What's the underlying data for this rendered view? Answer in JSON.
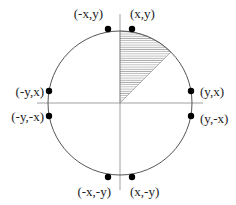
{
  "diagram": {
    "center": {
      "x": 120,
      "y": 103
    },
    "radius": 72,
    "colors": {
      "stroke": "#555555",
      "axis": "#888888",
      "dot": "#000000",
      "hatch": "#666666"
    },
    "shaded_octant": {
      "from_deg": 45,
      "to_deg": 90
    },
    "points": [
      {
        "label": "(x,y)",
        "cx": 132,
        "cy": 29,
        "lx": 130,
        "ly": 18,
        "anchor": "start"
      },
      {
        "label": "(-x,y)",
        "cx": 108,
        "cy": 29,
        "lx": 103,
        "ly": 18,
        "anchor": "end"
      },
      {
        "label": "(y,x)",
        "cx": 191,
        "cy": 91,
        "lx": 200,
        "ly": 96,
        "anchor": "start"
      },
      {
        "label": "(-y,x)",
        "cx": 49,
        "cy": 91,
        "lx": 44,
        "ly": 96,
        "anchor": "end"
      },
      {
        "label": "(y,-x)",
        "cx": 191,
        "cy": 116,
        "lx": 200,
        "ly": 123,
        "anchor": "start"
      },
      {
        "label": "(-y,-x)",
        "cx": 49,
        "cy": 116,
        "lx": 44,
        "ly": 121,
        "anchor": "end"
      },
      {
        "label": "(x,-y)",
        "cx": 132,
        "cy": 177,
        "lx": 130,
        "ly": 196,
        "anchor": "start"
      },
      {
        "label": "(-x,-y)",
        "cx": 108,
        "cy": 177,
        "lx": 111,
        "ly": 196,
        "anchor": "end"
      }
    ]
  }
}
